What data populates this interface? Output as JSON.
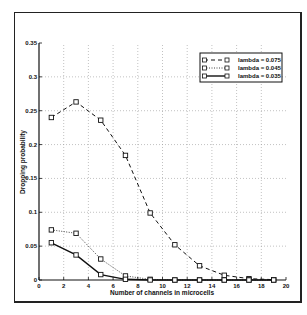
{
  "chart_data": {
    "type": "line",
    "title": "",
    "xlabel": "Number of channels in microcells",
    "ylabel": "Dropping probability",
    "xlim": [
      0,
      20
    ],
    "ylim": [
      0,
      0.35
    ],
    "xticks": [
      0,
      2,
      4,
      6,
      8,
      10,
      12,
      14,
      16,
      18,
      20
    ],
    "yticks": [
      0,
      0.05,
      0.1,
      0.15,
      0.2,
      0.25,
      0.3,
      0.35
    ],
    "ytick_labels": [
      "0",
      "0.05",
      "0.1",
      "0.15",
      "0.2",
      "0.25",
      "0.3",
      "0.35"
    ],
    "grid": true,
    "legend_position": "upper right",
    "x": [
      1,
      3,
      5,
      7,
      9,
      11,
      13,
      15,
      17,
      19
    ],
    "series": [
      {
        "name": "lambda = 0.075",
        "style": "dashed",
        "marker": "square",
        "values": [
          0.24,
          0.263,
          0.236,
          0.184,
          0.099,
          0.052,
          0.021,
          0.007,
          0.002,
          0.0005
        ]
      },
      {
        "name": "lambda = 0.045",
        "style": "dotted",
        "marker": "square",
        "values": [
          0.074,
          0.069,
          0.031,
          0.006,
          0.001,
          0.0,
          0.0,
          0.0,
          0.0,
          0.0
        ]
      },
      {
        "name": "lambda = 0.035",
        "style": "solid",
        "marker": "square",
        "values": [
          0.055,
          0.037,
          0.008,
          0.001,
          0.0,
          0.0,
          0.0,
          0.0,
          0.0,
          0.0
        ]
      }
    ]
  }
}
